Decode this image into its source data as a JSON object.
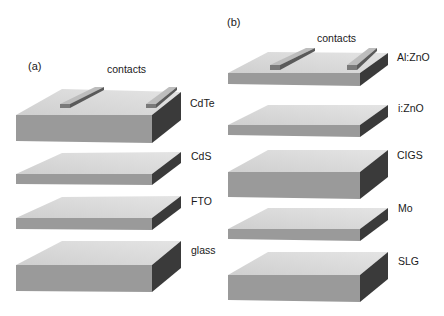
{
  "figure": {
    "panels": [
      {
        "id": "a",
        "label": "(a)",
        "contacts_label": "contacts",
        "layers": [
          {
            "name": "CdTe"
          },
          {
            "name": "CdS"
          },
          {
            "name": "FTO"
          },
          {
            "name": "glass"
          }
        ]
      },
      {
        "id": "b",
        "label": "(b)",
        "contacts_label": "contacts",
        "layers": [
          {
            "name": "Al:ZnO"
          },
          {
            "name": "i:ZnO"
          },
          {
            "name": "CIGS"
          },
          {
            "name": "Mo"
          },
          {
            "name": "SLG"
          }
        ]
      }
    ],
    "colors": {
      "top_face": "#d9d9d9",
      "front_face": "#9a9a9a",
      "side_face": "#3a3a3a",
      "contact_top": "#bdbdbd",
      "contact_side": "#6a6a6a"
    }
  }
}
